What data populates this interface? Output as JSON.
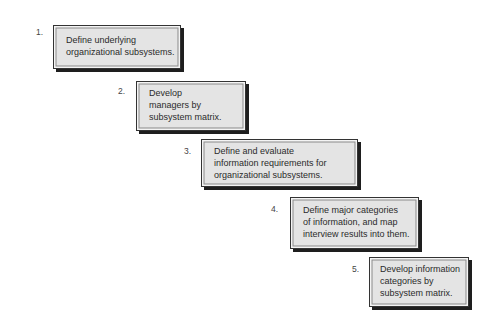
{
  "diagram": {
    "type": "staircase-process",
    "steps": [
      {
        "number": "1.",
        "lines": [
          "Define underlying",
          "organizational subsystems."
        ]
      },
      {
        "number": "2.",
        "lines": [
          "Develop",
          "managers by",
          "subsystem matrix."
        ]
      },
      {
        "number": "3.",
        "lines": [
          "Define and evaluate",
          "information requirements for",
          "organizational subsystems."
        ]
      },
      {
        "number": "4.",
        "lines": [
          "Define major categories",
          "of information, and map",
          "interview results into them."
        ]
      },
      {
        "number": "5.",
        "lines": [
          "Develop information",
          "categories by",
          "subsystem matrix."
        ]
      }
    ],
    "colors": {
      "box_fill": "#e4e4e4",
      "box_border": "#333333",
      "shadow": "#1e1e1e",
      "text": "#2b2b2b"
    }
  }
}
